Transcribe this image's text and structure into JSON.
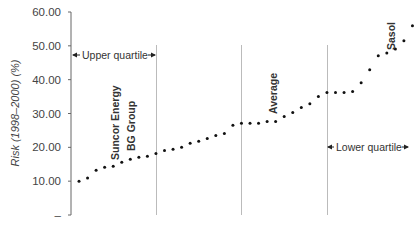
{
  "chart_data": {
    "type": "scatter",
    "title": "",
    "xlabel": "",
    "ylabel": "Risk (1998–2000) (%)",
    "ylim": [
      0,
      60
    ],
    "yticks": [
      0,
      10,
      20,
      30,
      40,
      50,
      60
    ],
    "ytick_labels": [
      "–",
      "10.00",
      "20.00",
      "30.00",
      "40.00",
      "50.00",
      "60.00"
    ],
    "grid": false,
    "legend": null,
    "series": [
      {
        "name": "Companies ranked by risk",
        "values": [
          10.0,
          10.9,
          13.2,
          14.1,
          14.4,
          15.6,
          16.5,
          17.1,
          17.4,
          18.2,
          19.1,
          19.4,
          20.0,
          21.2,
          21.8,
          22.6,
          23.5,
          24.1,
          26.5,
          27.1,
          27.1,
          27.1,
          27.6,
          27.6,
          29.1,
          30.3,
          31.8,
          32.9,
          35.0,
          36.2,
          36.2,
          36.2,
          36.5,
          39.1,
          42.9,
          47.1,
          47.9,
          49.1,
          51.5,
          55.9
        ]
      }
    ],
    "dividers_after_index": [
      9,
      19,
      29
    ],
    "annotations": [
      {
        "text": "Upper quartile",
        "type": "range-arrow",
        "from_index": -1,
        "to_index": 9,
        "y": 47
      },
      {
        "text": "Lower quartile",
        "type": "range-arrow",
        "from_index": 29,
        "to_index": 40,
        "y": 24
      },
      {
        "text": "Suncor Energy",
        "type": "point-label",
        "index": 4,
        "rotated": true
      },
      {
        "text": "BG Group",
        "type": "point-label",
        "index": 6,
        "rotated": true
      },
      {
        "text": "Average",
        "type": "point-label",
        "index": 24,
        "rotated": true
      },
      {
        "text": "Sasol",
        "type": "point-label",
        "index": 37,
        "rotated": true
      }
    ]
  },
  "labels": {
    "upper_quartile": "Upper quartile",
    "lower_quartile": "Lower quartile",
    "suncor": "Suncor Energy",
    "bg_group": "BG Group",
    "average": "Average",
    "sasol": "Sasol",
    "ylabel": "Risk (1998–2000) (%)"
  }
}
